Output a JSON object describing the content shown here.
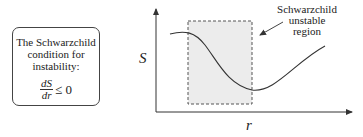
{
  "condition_box": {
    "lines": [
      "The Schwarzchild",
      "condition for",
      "instability:"
    ],
    "formula": {
      "numerator": "dS",
      "denominator": "dr",
      "relation": "≤ 0"
    }
  },
  "plot": {
    "y_axis_label": "S",
    "x_axis_label": "r",
    "region_label_lines": [
      "Schwarzchild",
      "unstable",
      "region"
    ]
  },
  "colors": {
    "region_fill": "#ececec",
    "stroke": "#444444"
  }
}
